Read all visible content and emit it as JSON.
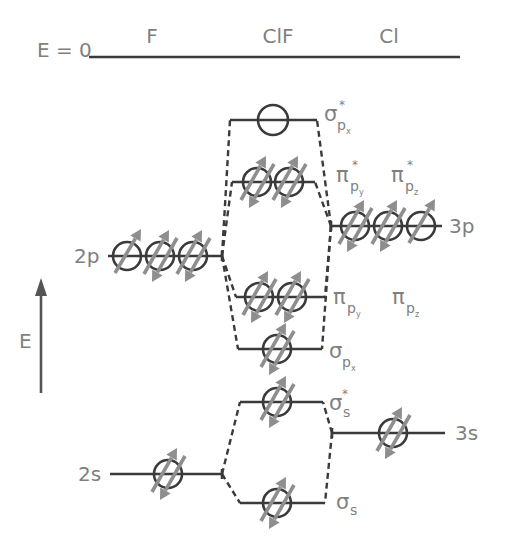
{
  "header": {
    "energy_zero_label": "E = 0",
    "columns": {
      "left": "F",
      "center": "ClF",
      "right": "Cl"
    }
  },
  "axis": {
    "label": "E",
    "direction": "up"
  },
  "atomic_orbitals": {
    "F_2p": {
      "atom": "F",
      "label": "2p",
      "electrons": [
        1,
        2,
        2
      ]
    },
    "F_2s": {
      "atom": "F",
      "label": "2s",
      "electrons": [
        2
      ]
    },
    "Cl_3p": {
      "atom": "Cl",
      "label": "3p",
      "electrons": [
        2,
        2,
        1
      ]
    },
    "Cl_3s": {
      "atom": "Cl",
      "label": "3s",
      "electrons": [
        2
      ]
    }
  },
  "molecular_orbitals": {
    "sigma_px_star": {
      "symbol": "σ",
      "sub": "p",
      "subsub": "x",
      "star": "*",
      "electrons": [
        0
      ]
    },
    "pi_star": {
      "electrons": [
        2,
        2
      ],
      "labels": [
        {
          "symbol": "π",
          "sub": "p",
          "subsub": "y",
          "star": "*"
        },
        {
          "symbol": "π",
          "sub": "p",
          "subsub": "z",
          "star": "*"
        }
      ]
    },
    "pi": {
      "electrons": [
        2,
        2
      ],
      "labels": [
        {
          "symbol": "π",
          "sub": "p",
          "subsub": "y"
        },
        {
          "symbol": "π",
          "sub": "p",
          "subsub": "z"
        }
      ]
    },
    "sigma_px": {
      "symbol": "σ",
      "sub": "p",
      "subsub": "x",
      "electrons": [
        2
      ]
    },
    "sigma_s_star": {
      "symbol": "σ",
      "sub": "s",
      "star": "*",
      "electrons": [
        2
      ]
    },
    "sigma_s": {
      "symbol": "σ",
      "sub": "s",
      "electrons": [
        2
      ]
    }
  },
  "colors": {
    "line": "#3a3a3a",
    "electron": "#8e8e8e",
    "text": "#7f7f7f"
  }
}
